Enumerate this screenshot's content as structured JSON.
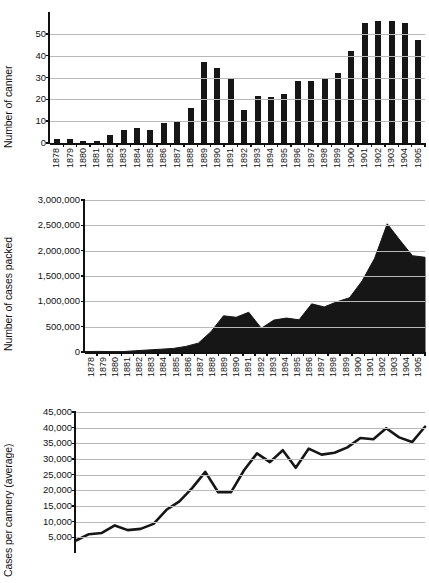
{
  "figure": {
    "background": "#ffffff",
    "ink": "#161616",
    "gridline_color": "#b9b9b9"
  },
  "years": [
    "1878",
    "1879",
    "1880",
    "1881",
    "1882",
    "1883",
    "1884",
    "1885",
    "1886",
    "1887",
    "1888",
    "1889",
    "1890",
    "1891",
    "1892",
    "1893",
    "1894",
    "1895",
    "1896",
    "1897",
    "1898",
    "1899",
    "1900",
    "1901",
    "1902",
    "1903",
    "1904",
    "1905"
  ],
  "chart_data": [
    {
      "id": "canneries",
      "type": "bar",
      "title": "",
      "xlabel": "",
      "ylabel": "Number of canner",
      "categories": [
        "1878",
        "1879",
        "1880",
        "1881",
        "1882",
        "1883",
        "1884",
        "1885",
        "1886",
        "1887",
        "1888",
        "1889",
        "1890",
        "1891",
        "1892",
        "1893",
        "1894",
        "1895",
        "1896",
        "1897",
        "1898",
        "1899",
        "1900",
        "1901",
        "1902",
        "1903",
        "1904",
        "1905"
      ],
      "values": [
        2,
        2,
        1,
        1,
        3.5,
        6,
        7,
        6,
        9,
        10,
        16,
        37,
        34.5,
        30,
        15,
        21.5,
        21,
        22.5,
        28.5,
        28.5,
        30,
        32,
        42,
        55,
        56,
        56,
        55,
        47
      ],
      "ylim": [
        0,
        60
      ],
      "yticks": [
        0,
        10,
        20,
        30,
        40,
        50
      ],
      "ytick_labels": [
        "0",
        "10",
        "20",
        "30",
        "40",
        "50"
      ],
      "grid": true,
      "legend": "none"
    },
    {
      "id": "cases-packed",
      "type": "area",
      "title": "",
      "xlabel": "",
      "ylabel": "Number of cases packed",
      "categories": [
        "1878",
        "1879",
        "1880",
        "1881",
        "1882",
        "1883",
        "1884",
        "1885",
        "1886",
        "1887",
        "1888",
        "1889",
        "1890",
        "1891",
        "1892",
        "1893",
        "1894",
        "1895",
        "1896",
        "1897",
        "1898",
        "1899",
        "1900",
        "1901",
        "1902",
        "1903",
        "1904",
        "1905"
      ],
      "values": [
        8000,
        12000,
        8000,
        7000,
        25000,
        40000,
        55000,
        70000,
        110000,
        175000,
        400000,
        715000,
        685000,
        785000,
        470000,
        630000,
        670000,
        635000,
        950000,
        890000,
        990000,
        1070000,
        1400000,
        1850000,
        2530000,
        2210000,
        1900000,
        1870000
      ],
      "ylim": [
        0,
        3000000
      ],
      "yticks": [
        0,
        500000,
        1000000,
        1500000,
        2000000,
        2500000,
        3000000
      ],
      "ytick_labels": [
        "0",
        "500,000",
        "1,000,000",
        "1,500,000",
        "2,000,000",
        "2,500,000",
        "3,000,000"
      ],
      "grid": true,
      "legend": "none"
    },
    {
      "id": "cases-per-cannery",
      "type": "line",
      "title": "",
      "xlabel": "",
      "ylabel": "Cases per cannery (average)",
      "categories": [
        "1878",
        "1879",
        "1880",
        "1881",
        "1882",
        "1883",
        "1884",
        "1885",
        "1886",
        "1887",
        "1888",
        "1889",
        "1890",
        "1891",
        "1892",
        "1893",
        "1894",
        "1895",
        "1896",
        "1897",
        "1898",
        "1899",
        "1900",
        "1901",
        "1902",
        "1903",
        "1904",
        "1905"
      ],
      "values": [
        4000,
        6000,
        6400,
        8800,
        7300,
        7700,
        9300,
        13800,
        16500,
        20800,
        25900,
        19400,
        19400,
        26400,
        31800,
        29000,
        32800,
        27200,
        33300,
        31400,
        32000,
        33700,
        36700,
        36300,
        39800,
        36900,
        35400,
        40300
      ],
      "ylim": [
        0,
        45000
      ],
      "yticks": [
        5000,
        10000,
        15000,
        20000,
        25000,
        30000,
        35000,
        40000,
        45000
      ],
      "ytick_labels": [
        "5,000",
        "10,000",
        "15,000",
        "20,000",
        "25,000",
        "30,000",
        "35,000",
        "40,000",
        "45,000"
      ],
      "grid": true,
      "legend": "none",
      "note": "x-axis tick labels cropped below image edge"
    }
  ]
}
